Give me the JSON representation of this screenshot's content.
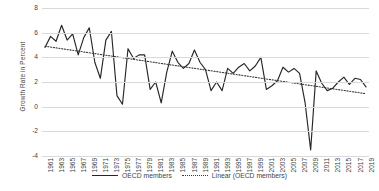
{
  "chart_data": {
    "type": "line",
    "title": "",
    "xlabel": "",
    "ylabel": "Growth Rate in Percent",
    "ylim": [
      -4,
      8
    ],
    "ytick_step": 2,
    "yticks": [
      8,
      6,
      4,
      2,
      0,
      -2,
      -4
    ],
    "grid": true,
    "xlim": [
      1961,
      2019
    ],
    "x_tick_labels": [
      "1961",
      "1963",
      "1965",
      "1967",
      "1969",
      "1971",
      "1973",
      "1975",
      "1977",
      "1979",
      "1981",
      "1983",
      "1985",
      "1987",
      "1989",
      "1991",
      "1993",
      "1995",
      "1997",
      "1999",
      "2001",
      "2003",
      "2005",
      "2007",
      "2009",
      "2011",
      "2013",
      "2015",
      "2017",
      "2019"
    ],
    "legend_position": "bottom",
    "legend": [
      "OECD members",
      "Linear (OECD members)"
    ],
    "x": [
      1961,
      1962,
      1963,
      1964,
      1965,
      1966,
      1967,
      1968,
      1969,
      1970,
      1971,
      1972,
      1973,
      1974,
      1975,
      1976,
      1977,
      1978,
      1979,
      1980,
      1981,
      1982,
      1983,
      1984,
      1985,
      1986,
      1987,
      1988,
      1989,
      1990,
      1991,
      1992,
      1993,
      1994,
      1995,
      1996,
      1997,
      1998,
      1999,
      2000,
      2001,
      2002,
      2003,
      2004,
      2005,
      2006,
      2007,
      2008,
      2009,
      2010,
      2011,
      2012,
      2013,
      2014,
      2015,
      2016,
      2017,
      2018,
      2019
    ],
    "series": [
      {
        "name": "OECD members",
        "style": "solid",
        "color": "#262626",
        "values": [
          4.8,
          5.7,
          5.3,
          6.6,
          5.4,
          5.9,
          4.2,
          5.6,
          6.4,
          3.6,
          2.3,
          5.4,
          6.1,
          0.9,
          0.2,
          4.7,
          3.9,
          4.2,
          4.2,
          1.4,
          2.0,
          0.3,
          2.8,
          4.5,
          3.6,
          3.1,
          3.5,
          4.6,
          3.6,
          3.0,
          1.3,
          2.0,
          1.3,
          3.1,
          2.7,
          3.2,
          3.5,
          2.9,
          3.3,
          4.0,
          1.4,
          1.7,
          2.1,
          3.2,
          2.8,
          3.1,
          2.7,
          0.3,
          -3.5,
          2.9,
          1.9,
          1.3,
          1.5,
          2.0,
          2.4,
          1.8,
          2.3,
          2.2,
          1.6
        ]
      },
      {
        "name": "Linear (OECD members)",
        "style": "dotted",
        "color": "#3a3a3a",
        "trend_start": 4.9,
        "trend_end": 1.05
      }
    ]
  }
}
